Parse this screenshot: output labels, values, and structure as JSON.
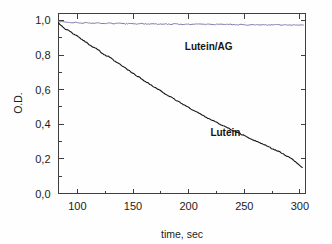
{
  "chart_data": {
    "type": "line",
    "title": "",
    "subtitle": "",
    "xlabel": "time, sec",
    "ylabel": "O.D.",
    "xlim": [
      83,
      305
    ],
    "ylim": [
      0.0,
      1.04
    ],
    "grid": false,
    "legend_position": "inline-annotation",
    "decimal_separator": ",",
    "x_ticks": [
      100,
      150,
      200,
      250,
      300
    ],
    "x_tick_labels": [
      "100",
      "150",
      "200",
      "250",
      "300"
    ],
    "x_minor_ticks": [
      125,
      175,
      225,
      275
    ],
    "y_ticks": [
      0.0,
      0.2,
      0.4,
      0.6,
      0.8,
      1.0
    ],
    "y_tick_labels": [
      "0,0",
      "0,2",
      "0,4",
      "0,6",
      "0,8",
      "1,0"
    ],
    "y_minor_ticks": [
      0.1,
      0.3,
      0.5,
      0.7,
      0.9
    ],
    "axis_color": "#3f3f3f",
    "background_color": "#fefefe",
    "series": [
      {
        "name": "Lutein",
        "color": "#161616",
        "line_width": 1.1,
        "label_x": 233,
        "label_y": 0.355,
        "x": [
          83,
          86,
          89,
          92,
          95,
          98,
          101,
          104,
          107,
          110,
          113,
          116,
          119,
          122,
          125,
          128,
          131,
          134,
          137,
          140,
          143,
          146,
          149,
          152,
          155,
          158,
          161,
          164,
          167,
          170,
          173,
          176,
          179,
          182,
          185,
          188,
          191,
          194,
          197,
          200,
          203,
          206,
          209,
          212,
          215,
          218,
          221,
          224,
          227,
          230,
          233,
          236,
          239,
          242,
          245,
          248,
          251,
          254,
          257,
          260,
          263,
          266,
          269,
          272,
          275,
          278,
          281,
          284,
          287,
          290,
          293,
          296,
          299,
          302
        ],
        "y": [
          0.985,
          0.968,
          0.952,
          0.941,
          0.928,
          0.915,
          0.906,
          0.889,
          0.878,
          0.864,
          0.85,
          0.841,
          0.829,
          0.812,
          0.798,
          0.791,
          0.777,
          0.762,
          0.751,
          0.737,
          0.725,
          0.711,
          0.698,
          0.685,
          0.674,
          0.66,
          0.648,
          0.636,
          0.623,
          0.61,
          0.6,
          0.587,
          0.576,
          0.564,
          0.553,
          0.541,
          0.53,
          0.519,
          0.508,
          0.496,
          0.486,
          0.475,
          0.465,
          0.453,
          0.443,
          0.433,
          0.424,
          0.414,
          0.404,
          0.395,
          0.386,
          0.376,
          0.367,
          0.357,
          0.349,
          0.34,
          0.331,
          0.322,
          0.313,
          0.304,
          0.296,
          0.287,
          0.278,
          0.269,
          0.26,
          0.251,
          0.242,
          0.232,
          0.221,
          0.21,
          0.198,
          0.184,
          0.168,
          0.15
        ]
      },
      {
        "name": "Lutein/AG",
        "color": "#7b7bab",
        "line_width": 1.0,
        "label_x": 218,
        "label_y": 0.855,
        "x": [
          83,
          88,
          93,
          98,
          103,
          108,
          113,
          118,
          123,
          128,
          133,
          138,
          143,
          148,
          153,
          158,
          163,
          168,
          173,
          178,
          183,
          188,
          193,
          198,
          203,
          208,
          213,
          218,
          223,
          228,
          233,
          238,
          243,
          248,
          253,
          258,
          263,
          268,
          273,
          278,
          283,
          288,
          293,
          298,
          303
        ],
        "y": [
          0.995,
          0.99,
          0.986,
          0.988,
          0.984,
          0.987,
          0.983,
          0.986,
          0.982,
          0.985,
          0.981,
          0.984,
          0.98,
          0.983,
          0.979,
          0.982,
          0.978,
          0.981,
          0.978,
          0.98,
          0.977,
          0.98,
          0.977,
          0.979,
          0.976,
          0.979,
          0.976,
          0.978,
          0.975,
          0.978,
          0.975,
          0.977,
          0.974,
          0.977,
          0.974,
          0.976,
          0.974,
          0.976,
          0.973,
          0.976,
          0.973,
          0.975,
          0.973,
          0.975,
          0.974
        ]
      }
    ]
  }
}
